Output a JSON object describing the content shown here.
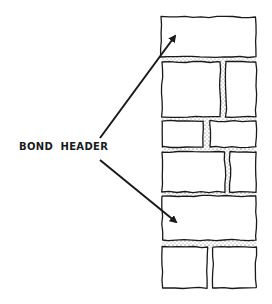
{
  "figure": {
    "label": "BOND  HEADER",
    "colors": {
      "ink": "#1a1a1a",
      "mortar": "#d8d8d8",
      "background": "#ffffff"
    },
    "arrows": [
      {
        "name": "upper-arrow",
        "from": [
          100,
          138
        ],
        "to": [
          175,
          36
        ]
      },
      {
        "name": "lower-arrow",
        "from": [
          100,
          160
        ],
        "to": [
          176,
          222
        ]
      }
    ],
    "courses": [
      {
        "type": "header",
        "y": 17,
        "h": 40,
        "bricks": [
          [
            161,
            256
          ]
        ]
      },
      {
        "type": "stretcher",
        "y": 62,
        "h": 55,
        "bricks": [
          [
            162,
            220
          ],
          [
            226,
            256
          ]
        ]
      },
      {
        "type": "stretcher",
        "y": 121,
        "h": 26,
        "bricks": [
          [
            162,
            203
          ],
          [
            210,
            256
          ]
        ]
      },
      {
        "type": "stretcher",
        "y": 152,
        "h": 40,
        "bricks": [
          [
            162,
            225
          ],
          [
            230,
            256
          ]
        ]
      },
      {
        "type": "header",
        "y": 196,
        "h": 44,
        "bricks": [
          [
            162,
            256
          ]
        ]
      },
      {
        "type": "stretcher",
        "y": 247,
        "h": 41,
        "bricks": [
          [
            162,
            207
          ],
          [
            213,
            256
          ]
        ]
      }
    ]
  }
}
